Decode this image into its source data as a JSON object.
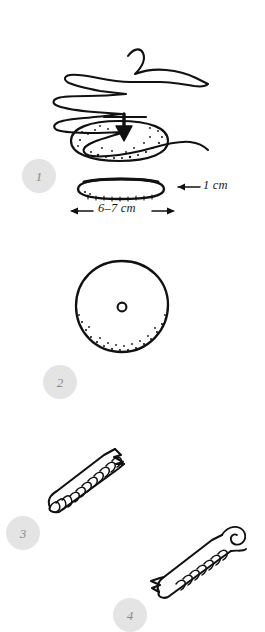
{
  "illustration": {
    "title": "Hand-drawn dough shaping steps",
    "background_color": "#ffffff",
    "ink_color": "#111111",
    "badge_fill": "#e4e4e4",
    "badge_text_color": "#8a8a8a"
  },
  "steps": [
    {
      "number": "1",
      "name": "flatten-dough-with-palm",
      "figures": [
        "hand-pressing-dough",
        "flattened-dough-side-view"
      ]
    },
    {
      "number": "2",
      "name": "pierce-center-hole",
      "figures": [
        "round-dough-disc-with-center-hole"
      ]
    },
    {
      "number": "3",
      "name": "roll-dough-into-rope",
      "figures": [
        "rolled-dough-rope",
        "rolled-dough-rope-with-curled-end"
      ]
    },
    {
      "number": "4",
      "name": "step-four-partial",
      "figures": [
        "partial-figure-cut-off-bottom"
      ]
    }
  ],
  "measurements": {
    "thickness_label": "1 cm",
    "width_label": "6–7 cm"
  },
  "icons": {
    "press-arrow": "downward-press-arrow",
    "thickness-arrow": "left-pointing-arrow",
    "width-arrow": "double-headed-horizontal-arrow"
  }
}
